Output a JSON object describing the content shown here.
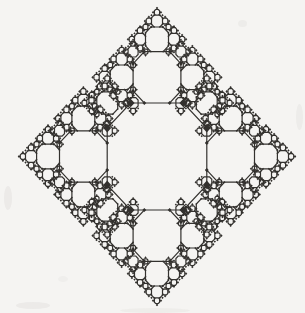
{
  "figure": {
    "kind": "recursive-octagon-fractal",
    "background_color": "#f5f4f2",
    "ink_color": "#33312e",
    "stroke_width": 1.2
  },
  "canvas": {
    "width": 305,
    "height": 313
  },
  "fractal": {
    "center_x": 157,
    "center_y": 156.5,
    "x_scale": 0.93,
    "root_octagon_width": 107,
    "corner_cut_fraction": 0.235,
    "axis_child_ratio": 0.48,
    "axis_child_distance": 0.74,
    "corner_child_ratio": 0.21,
    "corner_child_offset": 0.5,
    "min_octagon_width": 3.5,
    "terminal_min_width": 1.6,
    "terminal_radius_ratio": 0.5,
    "bead_min_width": 11,
    "bead_radius_ratio": 0.04,
    "bead_min_radius": 1.05
  },
  "scan_artifacts": [
    {
      "x": 4,
      "y": 186,
      "w": 8,
      "h": 24,
      "opacity": 0.1
    },
    {
      "x": 16,
      "y": 302,
      "w": 34,
      "h": 7,
      "opacity": 0.1
    },
    {
      "x": 120,
      "y": 308,
      "w": 70,
      "h": 5,
      "opacity": 0.07
    },
    {
      "x": 296,
      "y": 104,
      "w": 7,
      "h": 26,
      "opacity": 0.08
    },
    {
      "x": 238,
      "y": 20,
      "w": 9,
      "h": 7,
      "opacity": 0.08
    },
    {
      "x": 58,
      "y": 276,
      "w": 10,
      "h": 6,
      "opacity": 0.06
    }
  ]
}
